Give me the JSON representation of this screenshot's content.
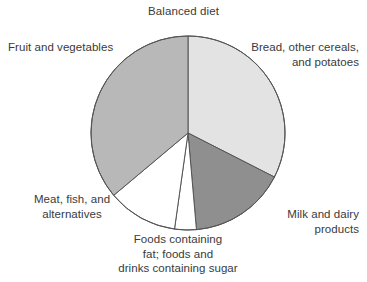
{
  "chart": {
    "title": "Balanced diet"
  },
  "chart_data": {
    "type": "pie",
    "title": "Balanced diet",
    "xlabel": "",
    "ylabel": "",
    "grid": false,
    "legend_position": "callout-labels",
    "start_angle_deg": 0,
    "direction": "clockwise",
    "center_px": [
      188,
      133
    ],
    "radius_px": 97,
    "categories": [
      "Bread, other cereals, and potatoes",
      "Milk and dairy products",
      "Foods containing fat; foods and drinks containing sugar",
      "Meat, fish, and alternatives",
      "Fruit and vegetables"
    ],
    "values": [
      32.5,
      16.0,
      3.5,
      11.5,
      36.5
    ],
    "units": "percent",
    "slices": [
      {
        "label": "Bread, other cereals, and potatoes",
        "label_lines": [
          "Bread, other cereals,",
          "and potatoes"
        ],
        "value": 32.5,
        "start_deg": 0,
        "end_deg": 117,
        "color": "#e3e3e3"
      },
      {
        "label": "Milk and dairy products",
        "label_lines": [
          "Milk and dairy",
          "products"
        ],
        "value": 16.0,
        "start_deg": 117,
        "end_deg": 175,
        "color": "#8f8f8f"
      },
      {
        "label": "Foods containing fat; foods and drinks containing sugar",
        "label_lines": [
          "Foods containing",
          "fat; foods and",
          "drinks containing sugar"
        ],
        "value": 3.5,
        "start_deg": 175,
        "end_deg": 188,
        "color": "#ffffff"
      },
      {
        "label": "Meat, fish, and alternatives",
        "label_lines": [
          "Meat, fish, and",
          "alternatives"
        ],
        "value": 11.5,
        "start_deg": 188,
        "end_deg": 230,
        "color": "#ffffff"
      },
      {
        "label": "Fruit and vegetables",
        "label_lines": [
          "Fruit and vegetables"
        ],
        "value": 36.5,
        "start_deg": 230,
        "end_deg": 360,
        "color": "#b8b8b8"
      }
    ],
    "stroke_color": "#555555",
    "colors": {
      "bread": "#e3e3e3",
      "milk": "#8f8f8f",
      "fats_sugar": "#ffffff",
      "meat": "#ffffff",
      "fruit": "#b8b8b8",
      "outline": "#555555",
      "text": "#3a3a3a",
      "background": "#ffffff"
    }
  },
  "labels": {
    "fruit": {
      "line1": "Fruit and vegetables"
    },
    "bread": {
      "line1": "Bread, other cereals,",
      "line2": "and potatoes"
    },
    "milk": {
      "line1": "Milk and dairy",
      "line2": "products"
    },
    "meat": {
      "line1": "Meat, fish, and",
      "line2": "alternatives"
    },
    "fats": {
      "line1": "Foods containing",
      "line2": "fat; foods and",
      "line3": "drinks containing sugar"
    }
  }
}
